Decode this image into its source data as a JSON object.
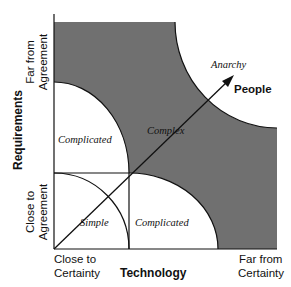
{
  "diagram": {
    "type": "stacey-matrix",
    "colors": {
      "complex_fill": "#707070",
      "background": "#ffffff",
      "line": "#111111"
    },
    "x_axis": {
      "title": "Technology",
      "low_label_line1": "Close to",
      "low_label_line2": "Certainty",
      "high_label_line1": "Far from",
      "high_label_line2": "Certainty"
    },
    "y_axis": {
      "title": "Requirements",
      "low_label_line1": "Close to",
      "low_label_line2": "Agreement",
      "high_label_line1": "Far from",
      "high_label_line2": "Agreement"
    },
    "regions": {
      "simple": "Simple",
      "complicated_requirements": "Complicated",
      "complicated_technology": "Complicated",
      "complex": "Complex",
      "anarchy": "Anarchy"
    },
    "diagonal_axis": {
      "label": "People"
    }
  }
}
